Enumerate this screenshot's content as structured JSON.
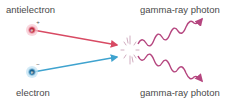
{
  "diagram": {
    "labels": {
      "antielectron": "antielectron",
      "electron": "electron",
      "photon_top": "gamma-ray photon",
      "photon_bottom": "gamma-ray photon"
    },
    "particles": {
      "antielectron": {
        "symbol": "e",
        "charge": "+",
        "color": "#c8334a"
      },
      "electron": {
        "symbol": "e",
        "charge": "−",
        "color": "#1d6fa0"
      }
    },
    "colors": {
      "antielectron_line": "#d84a63",
      "electron_line": "#3fa3cf",
      "photon": "#b5467f",
      "burst": "#c9a0b6",
      "text": "#4a4a4a"
    }
  }
}
